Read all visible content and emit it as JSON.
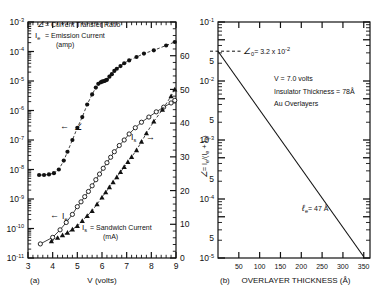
{
  "figure": {
    "panel_a_label": "(a)",
    "panel_b_label": "(b)"
  },
  "panel_a": {
    "xlabel": "V (volts)",
    "x_ticks": [
      "3",
      "4",
      "5",
      "6",
      "7",
      "8",
      "9"
    ],
    "xlim": [
      3,
      9
    ],
    "y_left_ticks": [
      "10",
      "10",
      "10",
      "10",
      "10",
      "10",
      "10",
      "10",
      "10"
    ],
    "y_left_exponents": [
      "-3",
      "-4",
      "-5",
      "-6",
      "-7",
      "-8",
      "-9",
      "-10",
      "-11"
    ],
    "y_right_ticks": [
      "0",
      "10",
      "20",
      "30",
      "40",
      "50",
      "60"
    ],
    "y_right_lim": [
      0,
      70
    ],
    "legend": {
      "line1_symbol": "∠",
      "line1_text": "= Current Transfer Ratio",
      "line2_symbol": "I",
      "line2_sub": "e",
      "line2_text": "= Emission Current",
      "line3_text": "(amp)"
    },
    "annotations": {
      "alpha_arrow": "←",
      "alpha_symbol": "∠",
      "ie_arrow": "←",
      "ie_symbol": "I",
      "ie_sub": "e",
      "is_symbol": "I",
      "is_sub": "s",
      "is_arrow": "→",
      "is_def_symbol": "I",
      "is_def_sub": "s",
      "is_def_text": "= Sandwich Current",
      "is_def_unit": "(mA)"
    }
  },
  "panel_b": {
    "xlabel": "OVERLAYER THICKNESS (Å)",
    "x_ticks": [
      "50",
      "100",
      "150",
      "200",
      "250",
      "300",
      "350"
    ],
    "xlim": [
      0,
      365
    ],
    "ylabel_parts": {
      "alpha": "∠",
      "eq": "= I",
      "sub1": "e",
      "mid": "/(I",
      "sub2": "e",
      "plus": " + I",
      "sub3": "s",
      "close": ")"
    },
    "y_ticks": [
      {
        "label": "10",
        "exp": "-1"
      },
      {
        "label": "5",
        "exp": ""
      },
      {
        "label": "10",
        "exp": "-2"
      },
      {
        "label": "5",
        "exp": ""
      },
      {
        "label": "10",
        "exp": "-3"
      },
      {
        "label": "5",
        "exp": ""
      },
      {
        "label": "10",
        "exp": "-4"
      },
      {
        "label": "5",
        "exp": ""
      },
      {
        "label": "10",
        "exp": "-5"
      }
    ],
    "annotations": {
      "alpha0_symbol": "∠",
      "alpha0_sub": "0",
      "alpha0_text": "= 3.2 x 10",
      "alpha0_exp": "-2",
      "voltage": "V = 7.0 volts",
      "thickness": "Insulator Thickness = 78Å",
      "overlayers": "Au Overlayers",
      "lambda_symbol": "ℓ",
      "lambda_sub": "e",
      "lambda_text": "= 47 Å"
    }
  },
  "chart_data": [
    {
      "type": "scatter",
      "panel": "(a)",
      "title": "",
      "xlabel": "V (volts)",
      "ylabel": "current (amp) / current transfer ratio",
      "ylabel_right": "I_s Sandwich Current (mA)",
      "xlim": [
        3,
        9
      ],
      "ylim_left_log": [
        1e-11,
        0.001
      ],
      "ylim_right": [
        0,
        70
      ],
      "grid": false,
      "legend_position": "upper-left",
      "series": [
        {
          "name": "alpha (Current Transfer Ratio)",
          "marker": "filled-circle",
          "axis": "left",
          "x": [
            3.45,
            3.65,
            3.85,
            4.05,
            4.25,
            4.45,
            4.6,
            4.8,
            5.0,
            5.2,
            5.4,
            5.6,
            5.75,
            5.85,
            5.95,
            6.0,
            6.05,
            6.1,
            6.15,
            6.2,
            6.3,
            6.4,
            6.5,
            6.6,
            6.75,
            6.9,
            7.1,
            7.4,
            7.7,
            8.1,
            8.6,
            8.95
          ],
          "y": [
            6.5e-09,
            6.5e-09,
            6.8e-09,
            7.5e-09,
            1e-08,
            2e-08,
            4e-08,
            1e-07,
            2.6e-07,
            6e-07,
            1.6e-06,
            3.5e-06,
            6e-06,
            8e-06,
            9e-06,
            9.5e-06,
            9.8e-06,
            1e-05,
            1.05e-05,
            1.1e-05,
            1.4e-05,
            1.7e-05,
            2.2e-05,
            2.6e-05,
            3.2e-05,
            4e-05,
            5e-05,
            6.5e-05,
            8.5e-05,
            0.00011,
            0.00016,
            0.00021
          ]
        },
        {
          "name": "I_e (Emission Current)",
          "marker": "open-circle",
          "axis": "left",
          "x": [
            3.5,
            4.0,
            4.3,
            4.55,
            4.8,
            5.0,
            5.15,
            5.3,
            5.45,
            5.6,
            5.75,
            5.9,
            6.05,
            6.2,
            6.35,
            6.5,
            6.7,
            6.9,
            7.1,
            7.35,
            7.6,
            7.9,
            8.2,
            8.5,
            8.8,
            8.95
          ],
          "y": [
            3e-11,
            5e-11,
            9e-11,
            1.6e-10,
            3e-10,
            5.5e-10,
            8e-10,
            1.2e-09,
            1.8e-09,
            2.8e-09,
            4.5e-09,
            7e-09,
            1.1e-08,
            1.7e-08,
            2.6e-08,
            4e-08,
            6.5e-08,
            1e-07,
            1.6e-07,
            2.6e-07,
            4e-07,
            6e-07,
            9e-07,
            1.3e-06,
            1.8e-06,
            2.2e-06
          ]
        },
        {
          "name": "I_s (Sandwich Current, mA)",
          "marker": "filled-triangle",
          "axis": "right",
          "x": [
            3.95,
            4.2,
            4.4,
            4.6,
            4.8,
            5.0,
            5.2,
            5.4,
            5.6,
            5.8,
            6.0,
            6.15,
            6.3,
            6.45,
            6.6,
            6.75,
            6.9,
            7.05,
            7.2,
            7.4,
            7.6,
            7.8,
            8.1,
            8.45,
            8.8,
            8.95
          ],
          "y": [
            5.0,
            6.0,
            6.8,
            7.5,
            8.5,
            9.5,
            11.0,
            12.5,
            14.0,
            16.0,
            18.0,
            19.5,
            21.0,
            22.5,
            24.0,
            25.5,
            27.0,
            28.5,
            30.0,
            32.0,
            34.5,
            37.0,
            40.5,
            44.0,
            48.0,
            50.0
          ]
        }
      ]
    },
    {
      "type": "line",
      "panel": "(b)",
      "title": "",
      "xlabel": "OVERLAYER THICKNESS (Å)",
      "ylabel": "α = I_e/(I_e + I_s)",
      "xlim": [
        0,
        365
      ],
      "ylim": [
        1e-05,
        0.1
      ],
      "grid": false,
      "series": [
        {
          "name": "alpha vs overlayer thickness (exp decay, lambda_e = 47 A)",
          "x": [
            0,
            350
          ],
          "y": [
            0.032,
            1.05e-05
          ]
        }
      ],
      "annotations": [
        {
          "text": "alpha_0 = 3.2 x 10^-2",
          "x": 0,
          "y": 0.032
        },
        {
          "text": "V = 7.0 volts",
          "x": 120,
          "y": 0.012
        },
        {
          "text": "Insulator Thickness = 78 A",
          "x": 120,
          "y": 0.0075
        },
        {
          "text": "Au Overlayers",
          "x": 120,
          "y": 0.005
        },
        {
          "text": "lambda_e = 47 A",
          "x": 250,
          "y": 6.5e-05
        }
      ]
    }
  ]
}
